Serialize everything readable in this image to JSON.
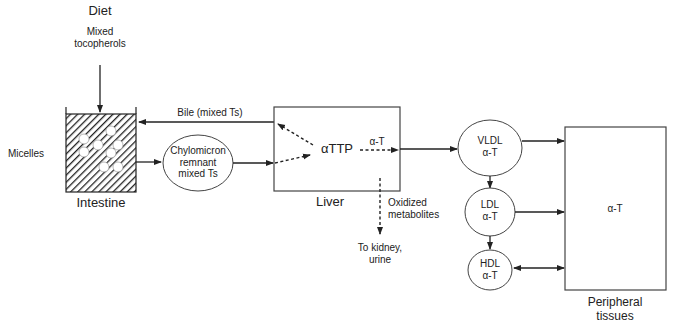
{
  "diagram": {
    "nodes": {
      "diet": {
        "title": "Diet",
        "subtitle_line1": "Mixed",
        "subtitle_line2": "tocopherols"
      },
      "intestine": {
        "label": "Intestine",
        "side_label": "Micelles"
      },
      "chylomicron": {
        "line1": "Chylomicron",
        "line2": "remnant",
        "line3": "mixed Ts"
      },
      "liver": {
        "label": "Liver",
        "center_label": "αTTP"
      },
      "vldl": {
        "line1": "VLDL",
        "line2": "α-T"
      },
      "ldl": {
        "line1": "LDL",
        "line2": "α-T"
      },
      "hdl": {
        "line1": "HDL",
        "line2": "α-T"
      },
      "peripheral": {
        "center_label": "α-T",
        "line1": "Peripheral",
        "line2": "tissues"
      }
    },
    "edges": {
      "bile": "Bile (mixed Ts)",
      "alpha_t_out": "α-T",
      "oxidized_line1": "Oxidized",
      "oxidized_line2": "metabolites",
      "kidney_line1": "To kidney,",
      "kidney_line2": "urine"
    },
    "colors": {
      "stroke": "#222222",
      "text": "#222222",
      "background": "#ffffff"
    }
  }
}
